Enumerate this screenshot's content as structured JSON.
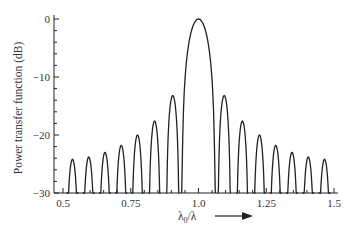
{
  "chart_data": {
    "type": "line",
    "title": "",
    "xlabel": "λ0/λ",
    "xlabel_main": "λ",
    "xlabel_sub": "0",
    "xlabel_tail": "/λ",
    "ylabel": "Power transfer function (dB)",
    "xlim": [
      0.5,
      1.5
    ],
    "ylim": [
      -30,
      0
    ],
    "x_ticks": [
      0.5,
      0.75,
      1.0,
      1.25,
      1.5
    ],
    "x_tick_labels": [
      "0.5",
      "0.75",
      "1.0",
      "1.25",
      "1.5"
    ],
    "y_ticks": [
      0,
      -10,
      -20,
      -30
    ],
    "y_tick_labels": [
      "0",
      "−10",
      "−20",
      "−30"
    ],
    "grid": false,
    "legend": null,
    "annotations": [
      "arrow pointing right next to x-axis label"
    ],
    "series": [
      {
        "name": "Power transfer function",
        "description": "sinc-squared shaped main lobe centered at 1.0 with symmetric decaying sidelobes",
        "lobes": [
          {
            "center": 0.535,
            "half_width": 0.022,
            "peak_db": -24.2
          },
          {
            "center": 0.595,
            "half_width": 0.022,
            "peak_db": -23.8
          },
          {
            "center": 0.655,
            "half_width": 0.022,
            "peak_db": -23.0
          },
          {
            "center": 0.715,
            "half_width": 0.022,
            "peak_db": -21.8
          },
          {
            "center": 0.775,
            "half_width": 0.022,
            "peak_db": -20.0
          },
          {
            "center": 0.838,
            "half_width": 0.022,
            "peak_db": -17.6
          },
          {
            "center": 0.905,
            "half_width": 0.024,
            "peak_db": -13.2
          },
          {
            "center": 1.0,
            "half_width": 0.062,
            "peak_db": 0.0
          },
          {
            "center": 1.095,
            "half_width": 0.024,
            "peak_db": -13.2
          },
          {
            "center": 1.162,
            "half_width": 0.022,
            "peak_db": -17.6
          },
          {
            "center": 1.225,
            "half_width": 0.022,
            "peak_db": -20.0
          },
          {
            "center": 1.285,
            "half_width": 0.022,
            "peak_db": -21.8
          },
          {
            "center": 1.345,
            "half_width": 0.022,
            "peak_db": -23.0
          },
          {
            "center": 1.405,
            "half_width": 0.022,
            "peak_db": -23.8
          },
          {
            "center": 1.465,
            "half_width": 0.022,
            "peak_db": -24.2
          }
        ]
      }
    ]
  }
}
